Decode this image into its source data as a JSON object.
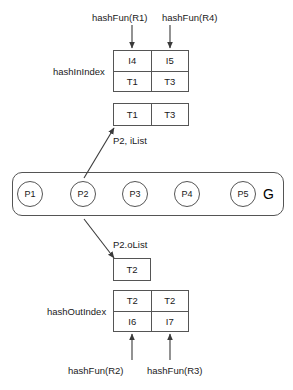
{
  "diagram": {
    "title_hidden": "",
    "top_inputs": [
      {
        "label": "hashFun(R1)"
      },
      {
        "label": "hashFun(R4)"
      }
    ],
    "bottom_inputs": [
      {
        "label": "hashFun(R2)"
      },
      {
        "label": "hashFun(R3)"
      }
    ],
    "hash_in_index": {
      "label": "hashInIndex",
      "rows": [
        [
          "I4",
          "I5"
        ],
        [
          "T1",
          "T3"
        ]
      ]
    },
    "hash_out_index": {
      "label": "hashOutIndex",
      "rows": [
        [
          "T2",
          "T2"
        ],
        [
          "I6",
          "I7"
        ]
      ]
    },
    "ilist": {
      "label": "P2, iList",
      "cells": [
        "T1",
        "T3"
      ]
    },
    "olist": {
      "label": "P2.oList",
      "cells": [
        "T2"
      ]
    },
    "graph": {
      "label": "G",
      "nodes": [
        {
          "label": "P1"
        },
        {
          "label": "P2"
        },
        {
          "label": "P3"
        },
        {
          "label": "P4"
        },
        {
          "label": "P5"
        }
      ]
    },
    "colors": {
      "stroke": "#555555",
      "text": "#1a1a1a",
      "background": "#ffffff"
    }
  }
}
